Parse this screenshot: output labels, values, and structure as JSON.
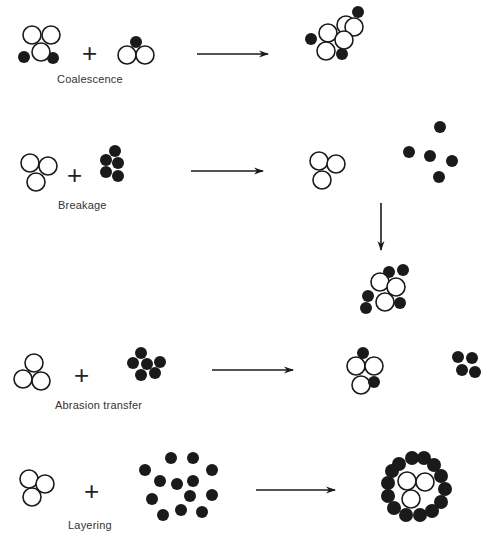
{
  "figure": {
    "colors": {
      "ink": "#1a1a1a",
      "background": "#ffffff",
      "label": "#333333"
    },
    "plus_sign": "+",
    "rows": [
      {
        "id": "coalescence",
        "label": "Coalescence",
        "label_pos": [
          57,
          82
        ],
        "plus_pos": [
          82,
          40
        ],
        "arrows": [
          {
            "x1": 197,
            "y1": 54,
            "x2": 268,
            "y2": 54
          }
        ],
        "particles": [
          {
            "group": "reactant-1",
            "open": [
              [
                32,
                35,
                9
              ],
              [
                51,
                35,
                9
              ],
              [
                41,
                52,
                9
              ]
            ],
            "filled": [
              [
                24,
                57,
                6
              ],
              [
                53,
                58,
                6
              ]
            ]
          },
          {
            "group": "reactant-2",
            "open": [
              [
                127,
                55,
                9
              ],
              [
                145,
                55,
                9
              ]
            ],
            "filled": [
              [
                136,
                42,
                6
              ]
            ]
          },
          {
            "group": "product",
            "open": [
              [
                328,
                33,
                9
              ],
              [
                346,
                25,
                9
              ],
              [
                354,
                27,
                9
              ],
              [
                344,
                40,
                9
              ],
              [
                326,
                51,
                9
              ]
            ],
            "filled": [
              [
                358,
                12,
                6
              ],
              [
                311,
                39,
                6
              ],
              [
                342,
                54,
                6
              ]
            ]
          }
        ]
      },
      {
        "id": "breakage",
        "label": "Breakage",
        "label_pos": [
          58,
          208
        ],
        "plus_pos": [
          67,
          162
        ],
        "arrows": [
          {
            "x1": 191,
            "y1": 171,
            "x2": 263,
            "y2": 171
          },
          {
            "x1": 381,
            "y1": 203,
            "x2": 381,
            "y2": 250
          }
        ],
        "particles": [
          {
            "group": "reactant-1",
            "open": [
              [
                30,
                163,
                9
              ],
              [
                48,
                166,
                9
              ],
              [
                36,
                182,
                9
              ]
            ],
            "filled": []
          },
          {
            "group": "reactant-2",
            "open": [],
            "filled": [
              [
                115,
                151,
                6
              ],
              [
                106,
                160,
                6
              ],
              [
                118,
                163,
                6
              ],
              [
                106,
                172,
                6
              ],
              [
                118,
                176,
                6
              ]
            ]
          },
          {
            "group": "product-open",
            "open": [
              [
                319,
                161,
                9
              ],
              [
                336,
                164,
                9
              ],
              [
                322,
                180,
                9
              ]
            ],
            "filled": []
          },
          {
            "group": "product-filled",
            "open": [],
            "filled": [
              [
                440,
                127,
                6
              ],
              [
                409,
                152,
                6
              ],
              [
                430,
                156,
                6
              ],
              [
                452,
                161,
                6
              ],
              [
                439,
                177,
                6
              ]
            ]
          },
          {
            "group": "recombined",
            "open": [
              [
                380,
                282,
                9
              ],
              [
                396,
                287,
                9
              ],
              [
                385,
                302,
                9
              ]
            ],
            "filled": [
              [
                389,
                272,
                6
              ],
              [
                403,
                270,
                6
              ],
              [
                368,
                296,
                6
              ],
              [
                366,
                308,
                6
              ],
              [
                400,
                303,
                6
              ]
            ]
          }
        ]
      },
      {
        "id": "abrasion-transfer",
        "label": "Abrasion transfer",
        "label_pos": [
          55,
          408
        ],
        "plus_pos": [
          74,
          362
        ],
        "arrows": [
          {
            "x1": 212,
            "y1": 370,
            "x2": 293,
            "y2": 370
          }
        ],
        "particles": [
          {
            "group": "reactant-1",
            "open": [
              [
                34,
                363,
                9
              ],
              [
                23,
                379,
                9
              ],
              [
                41,
                381,
                9
              ]
            ],
            "filled": []
          },
          {
            "group": "reactant-2",
            "open": [],
            "filled": [
              [
                141,
                353,
                6
              ],
              [
                133,
                363,
                6
              ],
              [
                147,
                364,
                6
              ],
              [
                160,
                362,
                6
              ],
              [
                141,
                375,
                6
              ],
              [
                155,
                373,
                6
              ]
            ]
          },
          {
            "group": "product-open",
            "open": [
              [
                356,
                366,
                9
              ],
              [
                374,
                366,
                9
              ],
              [
                361,
                385,
                9
              ]
            ],
            "filled": []
          },
          {
            "group": "product-filled-attached",
            "open": [],
            "filled": [
              [
                363,
                353,
                6
              ],
              [
                374,
                382,
                6
              ]
            ]
          },
          {
            "group": "product-fragment",
            "open": [],
            "filled": [
              [
                458,
                357,
                6
              ],
              [
                472,
                358,
                6
              ],
              [
                462,
                370,
                6
              ],
              [
                475,
                372,
                6
              ]
            ]
          }
        ]
      },
      {
        "id": "layering",
        "label": "Layering",
        "label_pos": [
          68,
          528
        ],
        "plus_pos": [
          84,
          478
        ],
        "arrows": [
          {
            "x1": 256,
            "y1": 490,
            "x2": 335,
            "y2": 490
          }
        ],
        "particles": [
          {
            "group": "reactant-1",
            "open": [
              [
                29,
                479,
                9
              ],
              [
                45,
                484,
                9
              ],
              [
                32,
                497,
                9
              ]
            ],
            "filled": []
          },
          {
            "group": "reactant-2",
            "open": [],
            "filled": [
              [
                171,
                458,
                6
              ],
              [
                193,
                458,
                6
              ],
              [
                145,
                470,
                6
              ],
              [
                212,
                470,
                6
              ],
              [
                160,
                481,
                6
              ],
              [
                177,
                484,
                6
              ],
              [
                193,
                481,
                6
              ],
              [
                190,
                496,
                6
              ],
              [
                212,
                495,
                6
              ],
              [
                152,
                499,
                6
              ],
              [
                181,
                510,
                6
              ],
              [
                202,
                512,
                6
              ],
              [
                163,
                515,
                6
              ]
            ]
          },
          {
            "group": "product-core",
            "open": [
              [
                407,
                481,
                9
              ],
              [
                425,
                482,
                9
              ],
              [
                411,
                499,
                9
              ]
            ],
            "filled": []
          },
          {
            "group": "product-coating",
            "open": [],
            "filled": [
              [
                399,
                464,
                7
              ],
              [
                412,
                458,
                7
              ],
              [
                424,
                458,
                7
              ],
              [
                434,
                465,
                7
              ],
              [
                441,
                476,
                7
              ],
              [
                445,
                489,
                7
              ],
              [
                441,
                502,
                7
              ],
              [
                432,
                511,
                7
              ],
              [
                420,
                515,
                7
              ],
              [
                406,
                515,
                7
              ],
              [
                394,
                508,
                7
              ],
              [
                388,
                496,
                7
              ],
              [
                388,
                483,
                7
              ],
              [
                392,
                471,
                7
              ]
            ]
          }
        ]
      }
    ]
  }
}
